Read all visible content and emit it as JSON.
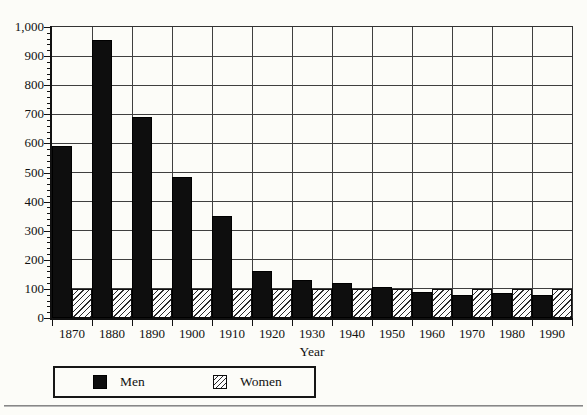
{
  "chart_data": {
    "type": "bar",
    "title": "",
    "xlabel": "Year",
    "ylabel": "",
    "categories": [
      "1870",
      "1880",
      "1890",
      "1900",
      "1910",
      "1920",
      "1930",
      "1940",
      "1950",
      "1960",
      "1970",
      "1980",
      "1990"
    ],
    "series": [
      {
        "name": "Men",
        "values": [
          590,
          955,
          690,
          485,
          350,
          160,
          130,
          120,
          105,
          90,
          80,
          85,
          80
        ]
      },
      {
        "name": "Women",
        "values": [
          100,
          100,
          100,
          100,
          100,
          100,
          100,
          100,
          100,
          100,
          100,
          100,
          100
        ]
      }
    ],
    "ylim": [
      0,
      1000
    ],
    "y_major_step": 100,
    "y_minor_step": 20,
    "y_tick_labels": [
      "0",
      "100",
      "200",
      "300",
      "400",
      "500",
      "600",
      "700",
      "800",
      "900",
      "1,000"
    ],
    "grid": true,
    "legend_position": "bottom",
    "bar_style": {
      "men": "solid-black",
      "women": "diagonal-hatch"
    },
    "colors": {
      "men_fill": "#0e0e0e",
      "women_hatch_line": "#2a2a2a",
      "gridline": "#3f3f3f",
      "axis": "#111111",
      "background": "#fcfcf8"
    }
  },
  "legend": {
    "men_label": "Men",
    "women_label": "Women"
  }
}
